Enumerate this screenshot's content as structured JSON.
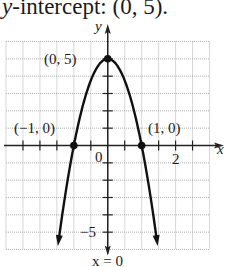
{
  "caption": {
    "prefix": "y",
    "text": "-intercept: (0, 5)."
  },
  "chart_data": {
    "type": "line",
    "title": "y-intercept: (0, 5).",
    "function": "y = 5 - 5x^2",
    "xlabel": "x",
    "ylabel": "y",
    "xlim": [
      -3,
      3
    ],
    "ylim": [
      -6,
      6
    ],
    "x_grid_step": 0.5,
    "y_grid_step": 1,
    "grid": true,
    "x_tick_labels": [
      {
        "value": 2,
        "label": "2"
      },
      {
        "value": 0,
        "label": "0"
      }
    ],
    "y_tick_labels": [
      {
        "value": -5,
        "label": "−5"
      }
    ],
    "points": [
      {
        "x": 0,
        "y": 5,
        "label": "(0, 5)"
      },
      {
        "x": -1,
        "y": 0,
        "label": "(−1, 0)"
      },
      {
        "x": 1,
        "y": 0,
        "label": "(1, 0)"
      }
    ],
    "annotations": [
      {
        "text": "x = 0",
        "meaning": "axis of symmetry"
      }
    ],
    "curve_samples": {
      "x": [
        -1.47,
        -1.25,
        -1,
        -0.75,
        -0.5,
        -0.25,
        0,
        0.25,
        0.5,
        0.75,
        1,
        1.25,
        1.47
      ],
      "y": [
        -5.8,
        -2.81,
        0,
        2.19,
        3.75,
        4.69,
        5,
        4.69,
        3.75,
        2.19,
        0,
        -2.81,
        -5.8
      ]
    },
    "arrows_at_ends": true
  },
  "labels": {
    "y_axis": "y",
    "x_axis": "x",
    "vertex": "(0, 5)",
    "left_root": "(−1, 0)",
    "right_root": "(1, 0)",
    "origin": "0",
    "x_tick_2": "2",
    "y_tick_neg5": "−5",
    "symmetry": "x = 0"
  }
}
